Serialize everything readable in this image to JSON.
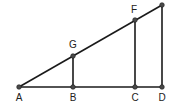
{
  "diagram": {
    "type": "geometry-similar-triangles",
    "points": {
      "A": {
        "label": "A",
        "x": 19,
        "y": 87,
        "lx": 19,
        "ly": 101
      },
      "B": {
        "label": "B",
        "x": 73,
        "y": 87,
        "lx": 73,
        "ly": 101
      },
      "C": {
        "label": "C",
        "x": 135,
        "y": 87,
        "lx": 135,
        "ly": 101
      },
      "D": {
        "label": "D",
        "x": 162,
        "y": 87,
        "lx": 162,
        "ly": 101
      },
      "G": {
        "label": "G",
        "x": 73,
        "y": 56,
        "lx": 73,
        "ly": 47
      },
      "F": {
        "label": "F",
        "x": 135,
        "y": 20,
        "lx": 134,
        "ly": 12
      },
      "E": {
        "label": "",
        "x": 162,
        "y": 5
      }
    },
    "segments": [
      [
        "A",
        "D"
      ],
      [
        "A",
        "E"
      ],
      [
        "G",
        "B"
      ],
      [
        "F",
        "C"
      ],
      [
        "E",
        "D"
      ]
    ]
  }
}
